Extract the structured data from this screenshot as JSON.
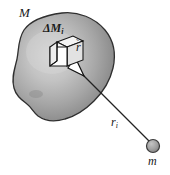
{
  "figure": {
    "labels": {
      "body_mass": "M",
      "mass_element_prefix": "ΔM",
      "mass_element_subscript": "i",
      "position_vector": "r",
      "position_vector_accent": "˜",
      "distance": "r",
      "distance_subscript": "i",
      "point_mass": "m"
    },
    "caption": "",
    "colors": {
      "blob_fill_light": "#c9c9c9",
      "blob_fill_dark": "#7d7d7d",
      "blob_outline": "#2b2b2b",
      "cube_fill": "#f2f2f2",
      "cube_outline": "#1a1a1a",
      "arrow_shaft": "#000000",
      "arrowhead_fill": "#ffffff",
      "line": "#1a1a1a",
      "point_mass_fill": "#9a9a9a",
      "point_mass_outline": "#3a3a3a",
      "text": "#1a1a1a",
      "background": "#ffffff"
    },
    "geometry": {
      "point_mass_center": [
        153,
        146
      ],
      "point_mass_radius": 6.5,
      "arrow_tail": [
        57,
        50
      ],
      "arrow_tip": [
        82,
        74
      ],
      "line_start": [
        82,
        74
      ],
      "line_end": [
        149,
        141
      ]
    }
  }
}
